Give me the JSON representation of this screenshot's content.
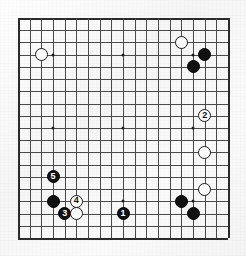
{
  "diagram": {
    "board_size": 19,
    "geometry": {
      "left": 18,
      "top": 18,
      "cell_w": 11.667,
      "cell_h": 12.222,
      "stone_size": 13
    },
    "star_points": [
      {
        "col": 3,
        "row": 3
      },
      {
        "col": 9,
        "row": 3
      },
      {
        "col": 15,
        "row": 3
      },
      {
        "col": 3,
        "row": 9
      },
      {
        "col": 9,
        "row": 9
      },
      {
        "col": 15,
        "row": 9
      },
      {
        "col": 3,
        "row": 15
      },
      {
        "col": 9,
        "row": 15
      },
      {
        "col": 15,
        "row": 15
      }
    ],
    "stones": [
      {
        "color": "white",
        "col": 2,
        "row": 3,
        "label": ""
      },
      {
        "color": "white",
        "col": 14,
        "row": 2,
        "label": ""
      },
      {
        "color": "black",
        "col": 16,
        "row": 3,
        "label": ""
      },
      {
        "color": "black",
        "col": 15,
        "row": 4,
        "label": ""
      },
      {
        "color": "white",
        "col": 16,
        "row": 8,
        "label": "2"
      },
      {
        "color": "white",
        "col": 16,
        "row": 11,
        "label": ""
      },
      {
        "color": "white",
        "col": 16,
        "row": 14,
        "label": ""
      },
      {
        "color": "black",
        "col": 14,
        "row": 15,
        "label": ""
      },
      {
        "color": "black",
        "col": 15,
        "row": 16,
        "label": ""
      },
      {
        "color": "black",
        "col": 3,
        "row": 13,
        "label": "5"
      },
      {
        "color": "black",
        "col": 3,
        "row": 15,
        "label": ""
      },
      {
        "color": "white",
        "col": 5,
        "row": 15,
        "label": "4"
      },
      {
        "color": "black",
        "col": 4,
        "row": 16,
        "label": "3"
      },
      {
        "color": "white",
        "col": 5,
        "row": 16,
        "label": ""
      },
      {
        "color": "black",
        "col": 9,
        "row": 16,
        "label": "1"
      }
    ],
    "colors": {
      "black_stone": "#111111",
      "white_stone": "#fbfbfb",
      "grid_line": "#4a4a4a",
      "board_edge": "#2b2b2b",
      "star_point": "#1d1d1d",
      "paper": "#fdfdfd"
    }
  }
}
